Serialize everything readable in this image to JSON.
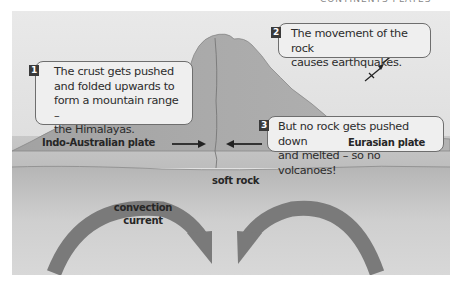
{
  "diagram": {
    "title_fragment": "CONTINENTS PLATES",
    "callouts": [
      {
        "number": "1",
        "lines": [
          "The crust gets pushed",
          "and folded upwards to",
          "form a mountain range –",
          "the Himalayas."
        ]
      },
      {
        "number": "2",
        "lines": [
          "The movement of the rock",
          "causes earthquakes."
        ]
      },
      {
        "number": "3",
        "lines": [
          "But no rock gets pushed down",
          "and melted – so no volcanoes!"
        ]
      }
    ],
    "labels": {
      "left_plate": "Indo-Australian plate",
      "right_plate": "Eurasian plate",
      "soft_rock": "soft rock",
      "convection_line1": "convection",
      "convection_line2": "current"
    },
    "icons": {
      "earthquake": "earthquake-zigzag-arrow",
      "left_plate_arrow": "arrow-right",
      "right_plate_arrow": "arrow-left",
      "convection_arrows": "curved-arrow"
    },
    "colors": {
      "sky": "#e4e4e4",
      "mountain": "#a9a9a9",
      "plate": "#bcbcbc",
      "mantle": "#c9c9c9",
      "arrow": "#7a7a7a",
      "badge": "#3a3a3a",
      "callout_bg": "#efefef"
    }
  }
}
